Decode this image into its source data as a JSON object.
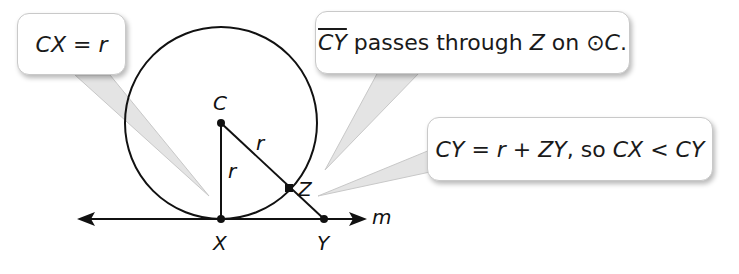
{
  "diagram": {
    "type": "geometry-proof-figure",
    "points": {
      "C": {
        "label": "C",
        "x": 221,
        "y": 123
      },
      "X": {
        "label": "X",
        "x": 221,
        "y": 219
      },
      "Y": {
        "label": "Y",
        "x": 324,
        "y": 219
      },
      "Z": {
        "label": "Z",
        "x": 289,
        "y": 188
      }
    },
    "circle": {
      "center": "C",
      "radius": 96
    },
    "line": {
      "label": "m"
    },
    "segment_labels": {
      "cx": "r",
      "cz": "r"
    },
    "colors": {
      "stroke": "#111111",
      "callout_border": "#c9c9c9",
      "pointer": "#d0d0d0"
    }
  },
  "callouts": {
    "left": {
      "lhs": "CX",
      "eq": " = ",
      "rhs": "r"
    },
    "top": {
      "seg": "CY",
      "text1": " passes through ",
      "pt": "Z",
      "text2": " on ",
      "circ": "⊙",
      "c": "C",
      "end": "."
    },
    "right": {
      "a": "CY",
      "b": " = ",
      "c": "r",
      "d": " + ",
      "e": "ZY",
      "f": ", so ",
      "g": "CX",
      "h": " < ",
      "i": "CY"
    }
  }
}
